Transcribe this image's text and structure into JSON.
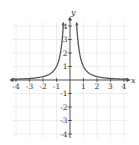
{
  "chart_data": {
    "type": "line",
    "title": "",
    "function": "y = 1/x^2",
    "xlabel": "x",
    "ylabel": "y",
    "xlim": [
      -4,
      4
    ],
    "ylim": [
      -4,
      4
    ],
    "grid": true,
    "x_ticks": [
      "-4",
      "-3",
      "-2",
      "-1",
      "1",
      "2",
      "3",
      "4"
    ],
    "y_ticks": [
      "4",
      "3",
      "2",
      "1",
      "-1",
      "-2",
      "-3",
      "-4"
    ],
    "series": [
      {
        "name": "left branch",
        "x": [
          -4,
          -3,
          -2,
          -1,
          -0.75,
          -0.6,
          -0.5
        ],
        "y": [
          0.0625,
          0.111,
          0.25,
          1,
          1.78,
          2.78,
          4
        ]
      },
      {
        "name": "right branch",
        "x": [
          0.5,
          0.6,
          0.75,
          1,
          2,
          3,
          4
        ],
        "y": [
          4,
          2.78,
          1.78,
          1,
          0.25,
          0.111,
          0.0625
        ]
      }
    ],
    "colors": {
      "curve": "#555555",
      "axis": "#444444",
      "grid": "#dddddd"
    }
  }
}
